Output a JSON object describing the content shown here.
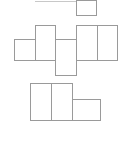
{
  "diagram": {
    "type": "cube-net-options",
    "stroke_color": "#9a9a9a",
    "background": "#ffffff",
    "figures": [
      {
        "name": "net-top-partial",
        "lines": [
          {
            "x": 35,
            "y": 1,
            "w": 41
          }
        ],
        "cells": [
          {
            "x": 76,
            "y": 0,
            "w": 21,
            "h": 16
          }
        ]
      },
      {
        "name": "net-middle",
        "cells": [
          {
            "x": 14,
            "y": 39,
            "w": 22,
            "h": 22
          },
          {
            "x": 35,
            "y": 25,
            "w": 21,
            "h": 36
          },
          {
            "x": 55,
            "y": 39,
            "w": 22,
            "h": 37
          },
          {
            "x": 76,
            "y": 25,
            "w": 22,
            "h": 36
          },
          {
            "x": 97,
            "y": 25,
            "w": 21,
            "h": 36
          }
        ]
      },
      {
        "name": "net-bottom",
        "cells": [
          {
            "x": 30,
            "y": 83,
            "w": 22,
            "h": 38
          },
          {
            "x": 51,
            "y": 83,
            "w": 22,
            "h": 38
          },
          {
            "x": 72,
            "y": 99,
            "w": 29,
            "h": 22
          }
        ]
      }
    ]
  }
}
